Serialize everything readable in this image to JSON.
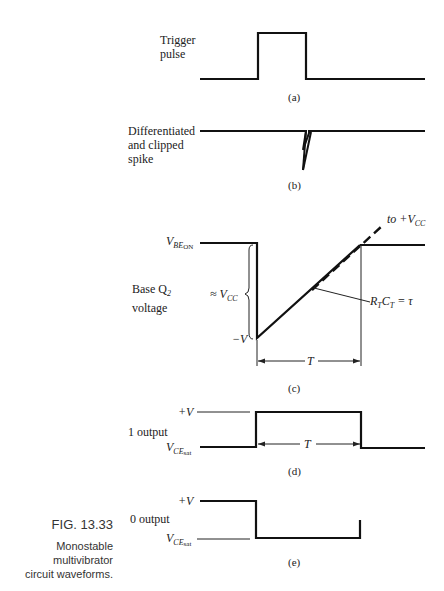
{
  "figure": {
    "number": "FIG. 13.33",
    "caption_line1": "Monostable multivibrator",
    "caption_line2": "circuit waveforms."
  },
  "panels": {
    "a": {
      "label_line1": "Trigger",
      "label_line2": "pulse",
      "tag": "(a)"
    },
    "b": {
      "label_line1": "Differentiated",
      "label_line2": "and clipped",
      "label_line3": "spike",
      "tag": "(b)"
    },
    "c": {
      "label_line1": "Base Q",
      "label_line1_sub": "2",
      "label_line2": "voltage",
      "vbe_main": "V",
      "vbe_sub": "BE",
      "vbe_subsub": "ON",
      "approx_vcc": "≈ V",
      "approx_vcc_sub": "CC",
      "neg_v": "−V",
      "to_vcc": "to +V",
      "to_vcc_sub": "CC",
      "rc_label": "R",
      "rc_label_sub1": "T",
      "rc_label_mid": "C",
      "rc_label_sub2": "T",
      "rc_label_end": " = τ",
      "period": "T",
      "tag": "(c)"
    },
    "d": {
      "label": "1 output",
      "plus_v": "+V",
      "vce_main": "V",
      "vce_sub": "CE",
      "vce_subsub": "sat",
      "period": "T",
      "tag": "(d)"
    },
    "e": {
      "label": "0 output",
      "plus_v": "+V",
      "vce_main": "V",
      "vce_sub": "CE",
      "vce_subsub": "sat",
      "tag": "(e)"
    }
  }
}
